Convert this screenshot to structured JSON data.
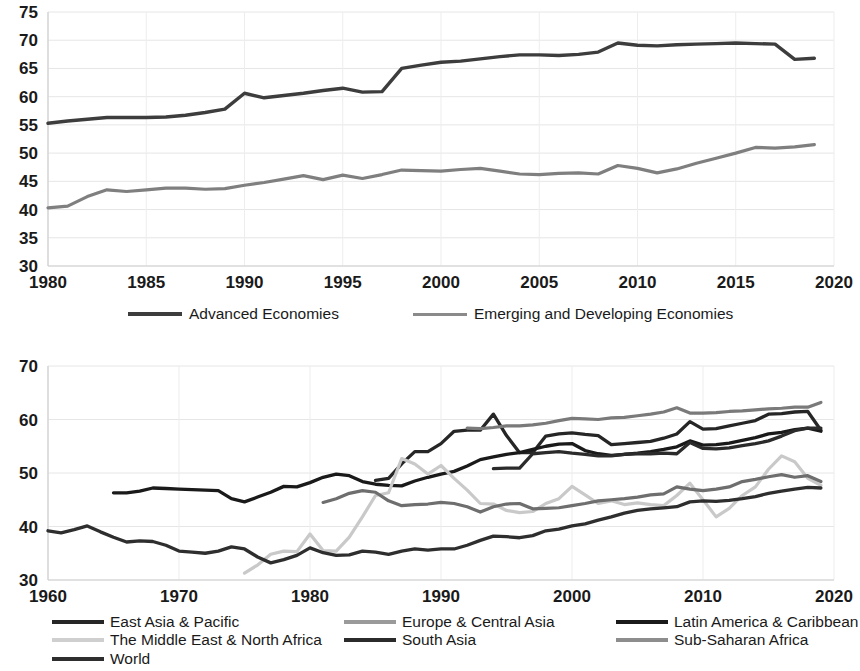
{
  "chart_data": [
    {
      "id": "top",
      "type": "line",
      "title": "",
      "xlabel": "",
      "ylabel": "",
      "xlim": [
        1980,
        2020
      ],
      "ylim": [
        30,
        75
      ],
      "xticks": [
        1980,
        1985,
        1990,
        1995,
        2000,
        2005,
        2010,
        2015,
        2020
      ],
      "yticks": [
        30,
        35,
        40,
        45,
        50,
        55,
        60,
        65,
        70,
        75
      ],
      "grid": "both-light",
      "legend_position": "below",
      "series": [
        {
          "name": "Advanced Economies",
          "color": "#3d3d3d",
          "width": 3.4,
          "x": [
            1980,
            1981,
            1982,
            1983,
            1984,
            1985,
            1986,
            1987,
            1988,
            1989,
            1990,
            1991,
            1992,
            1993,
            1994,
            1995,
            1996,
            1997,
            1998,
            1999,
            2000,
            2001,
            2002,
            2003,
            2004,
            2005,
            2006,
            2007,
            2008,
            2009,
            2010,
            2011,
            2012,
            2013,
            2014,
            2015,
            2016,
            2017,
            2018,
            2019
          ],
          "values": [
            55.3,
            55.7,
            56.0,
            56.3,
            56.3,
            56.3,
            56.4,
            56.7,
            57.2,
            57.8,
            60.6,
            59.8,
            60.2,
            60.6,
            61.1,
            61.5,
            60.8,
            60.9,
            65.0,
            65.6,
            66.1,
            66.3,
            66.7,
            67.1,
            67.4,
            67.4,
            67.3,
            67.5,
            67.9,
            69.5,
            69.1,
            69.0,
            69.2,
            69.3,
            69.4,
            69.5,
            69.4,
            69.3,
            66.6,
            66.8
          ]
        },
        {
          "name": "Emerging and Developing Economies",
          "color": "#7f7f7f",
          "width": 3.2,
          "x": [
            1980,
            1981,
            1982,
            1983,
            1984,
            1985,
            1986,
            1987,
            1988,
            1989,
            1990,
            1991,
            1992,
            1993,
            1994,
            1995,
            1996,
            1997,
            1998,
            1999,
            2000,
            2001,
            2002,
            2003,
            2004,
            2005,
            2006,
            2007,
            2008,
            2009,
            2010,
            2011,
            2012,
            2013,
            2014,
            2015,
            2016,
            2017,
            2018,
            2019
          ],
          "values": [
            40.3,
            40.6,
            42.3,
            43.5,
            43.2,
            43.5,
            43.8,
            43.8,
            43.6,
            43.7,
            44.3,
            44.8,
            45.4,
            46.0,
            45.3,
            46.1,
            45.5,
            46.2,
            47.0,
            46.9,
            46.8,
            47.1,
            47.3,
            46.8,
            46.3,
            46.2,
            46.4,
            46.5,
            46.3,
            47.8,
            47.3,
            46.5,
            47.2,
            48.2,
            49.1,
            50.0,
            51.0,
            50.9,
            51.1,
            51.5
          ]
        }
      ]
    },
    {
      "id": "bottom",
      "type": "line",
      "title": "",
      "xlabel": "",
      "ylabel": "",
      "xlim": [
        1960,
        2020
      ],
      "ylim": [
        30,
        70
      ],
      "xticks": [
        1960,
        1970,
        1980,
        1990,
        2000,
        2010,
        2020
      ],
      "yticks": [
        30,
        40,
        50,
        60,
        70
      ],
      "grid": "both-light",
      "legend_position": "below",
      "series": [
        {
          "name": "East Asia & Pacific",
          "color": "#262626",
          "width": 3.3,
          "x": [
            1985,
            1986,
            1987,
            1988,
            1989,
            1990,
            1991,
            1992,
            1993,
            1994,
            1995,
            1996,
            1997,
            1998,
            1999,
            2000,
            2001,
            2002,
            2003,
            2004,
            2005,
            2006,
            2007,
            2008,
            2009,
            2010,
            2011,
            2012,
            2013,
            2014,
            2015,
            2016,
            2017,
            2018,
            2019
          ],
          "values": [
            48.6,
            49.0,
            51.7,
            54.0,
            54.0,
            55.5,
            57.8,
            58.0,
            58.0,
            61.0,
            57.0,
            53.8,
            53.8,
            56.9,
            57.3,
            57.5,
            57.2,
            57.0,
            55.3,
            55.5,
            55.7,
            55.9,
            56.5,
            57.3,
            59.6,
            58.2,
            58.3,
            58.8,
            59.3,
            59.8,
            61.0,
            61.1,
            61.4,
            61.5,
            58.0
          ]
        },
        {
          "name": "Europe & Central Asia",
          "color": "#7a7a7a",
          "width": 3.2,
          "x": [
            1992,
            1993,
            1994,
            1995,
            1996,
            1997,
            1998,
            1999,
            2000,
            2001,
            2002,
            2003,
            2004,
            2005,
            2006,
            2007,
            2008,
            2009,
            2010,
            2011,
            2012,
            2013,
            2014,
            2015,
            2016,
            2017,
            2018,
            2019
          ],
          "values": [
            58.4,
            58.3,
            58.5,
            58.8,
            58.8,
            59.0,
            59.3,
            59.8,
            60.2,
            60.1,
            60.0,
            60.3,
            60.4,
            60.7,
            61.0,
            61.4,
            62.2,
            61.2,
            61.2,
            61.3,
            61.5,
            61.6,
            61.8,
            62.0,
            62.1,
            62.3,
            62.3,
            63.2
          ]
        },
        {
          "name": "Latin America & Caribbean",
          "color": "#1a1a1a",
          "width": 3.3,
          "x": [
            1965,
            1966,
            1967,
            1968,
            1969,
            1970,
            1971,
            1972,
            1973,
            1974,
            1975,
            1976,
            1977,
            1978,
            1979,
            1980,
            1981,
            1982,
            1983,
            1984,
            1985,
            1986,
            1987,
            1988,
            1989,
            1990,
            1991,
            1992,
            1993,
            1994,
            1995,
            1996,
            1997,
            1998,
            1999,
            2000,
            2001,
            2002,
            2003,
            2004,
            2005,
            2006,
            2007,
            2008,
            2009,
            2010,
            2011,
            2012,
            2013,
            2014,
            2015,
            2016,
            2017,
            2018,
            2019
          ],
          "values": [
            46.3,
            46.3,
            46.6,
            47.2,
            47.1,
            47.0,
            46.9,
            46.8,
            46.7,
            45.2,
            44.6,
            45.5,
            46.4,
            47.5,
            47.4,
            48.2,
            49.2,
            49.8,
            49.5,
            48.4,
            47.9,
            47.7,
            47.6,
            48.5,
            49.2,
            49.8,
            50.3,
            51.3,
            52.5,
            53.0,
            53.5,
            53.8,
            54.4,
            55.0,
            55.4,
            55.5,
            54.2,
            53.6,
            53.3,
            53.5,
            53.7,
            54.0,
            54.4,
            54.9,
            56.0,
            55.2,
            55.3,
            55.6,
            56.1,
            56.6,
            57.3,
            57.6,
            58.1,
            58.4,
            57.8
          ]
        },
        {
          "name": "The Middle East & North Africa",
          "color": "#c9c9c9",
          "width": 3.2,
          "x": [
            1975,
            1976,
            1977,
            1978,
            1979,
            1980,
            1981,
            1982,
            1983,
            1984,
            1985,
            1986,
            1987,
            1988,
            1989,
            1990,
            1991,
            1992,
            1993,
            1994,
            1995,
            1996,
            1997,
            1998,
            1999,
            2000,
            2001,
            2002,
            2003,
            2004,
            2005,
            2006,
            2007,
            2008,
            2009,
            2010,
            2011,
            2012,
            2013,
            2014,
            2015,
            2016,
            2017,
            2018,
            2019
          ],
          "values": [
            31.3,
            32.8,
            34.8,
            35.4,
            35.3,
            38.6,
            35.5,
            35.4,
            38.0,
            41.8,
            45.8,
            46.3,
            52.7,
            51.7,
            49.8,
            51.4,
            49.0,
            46.8,
            44.3,
            44.2,
            43.0,
            42.6,
            42.8,
            44.3,
            45.2,
            47.5,
            45.9,
            44.3,
            44.8,
            44.1,
            44.4,
            44.1,
            43.9,
            45.8,
            48.1,
            45.0,
            41.8,
            43.4,
            45.8,
            47.4,
            50.7,
            53.2,
            52.1,
            49.0,
            47.7
          ]
        },
        {
          "name": "South Asia",
          "color": "#2b2b2b",
          "width": 3.3,
          "x": [
            1994,
            1995,
            1996,
            1997,
            1998,
            1999,
            2000,
            2001,
            2002,
            2003,
            2004,
            2005,
            2006,
            2007,
            2008,
            2009,
            2010,
            2011,
            2012,
            2013,
            2014,
            2015,
            2016,
            2017,
            2018,
            2019
          ],
          "values": [
            50.8,
            50.9,
            50.9,
            53.6,
            53.8,
            54.0,
            53.7,
            53.5,
            53.2,
            53.2,
            53.5,
            53.6,
            53.6,
            53.7,
            53.6,
            55.7,
            54.6,
            54.5,
            54.7,
            55.1,
            55.5,
            56.0,
            56.9,
            57.9,
            58.4,
            58.4
          ]
        },
        {
          "name": "Sub-Saharan Africa",
          "color": "#6e6e6e",
          "width": 3.2,
          "x": [
            1981,
            1982,
            1983,
            1984,
            1985,
            1986,
            1987,
            1988,
            1989,
            1990,
            1991,
            1992,
            1993,
            1994,
            1995,
            1996,
            1997,
            1998,
            1999,
            2000,
            2001,
            2002,
            2003,
            2004,
            2005,
            2006,
            2007,
            2008,
            2009,
            2010,
            2011,
            2012,
            2013,
            2014,
            2015,
            2016,
            2017,
            2018,
            2019
          ],
          "values": [
            44.5,
            45.2,
            46.2,
            46.7,
            46.4,
            44.8,
            43.9,
            44.1,
            44.2,
            44.5,
            44.3,
            43.7,
            42.7,
            43.7,
            44.2,
            44.3,
            43.3,
            43.4,
            43.5,
            43.9,
            44.3,
            44.8,
            45.0,
            45.2,
            45.5,
            45.9,
            46.1,
            47.4,
            47.0,
            46.7,
            47.0,
            47.4,
            48.4,
            48.8,
            49.3,
            49.7,
            49.2,
            49.5,
            48.4
          ]
        },
        {
          "name": "World",
          "color": "#2e2e2e",
          "width": 3.3,
          "x": [
            1960,
            1961,
            1962,
            1963,
            1964,
            1965,
            1966,
            1967,
            1968,
            1969,
            1970,
            1971,
            1972,
            1973,
            1974,
            1975,
            1976,
            1977,
            1978,
            1979,
            1980,
            1981,
            1982,
            1983,
            1984,
            1985,
            1986,
            1987,
            1988,
            1989,
            1990,
            1991,
            1992,
            1993,
            1994,
            1995,
            1996,
            1997,
            1998,
            1999,
            2000,
            2001,
            2002,
            2003,
            2004,
            2005,
            2006,
            2007,
            2008,
            2009,
            2010,
            2011,
            2012,
            2013,
            2014,
            2015,
            2016,
            2017,
            2018,
            2019
          ],
          "values": [
            39.2,
            38.8,
            39.4,
            40.1,
            39.0,
            38.0,
            37.1,
            37.3,
            37.2,
            36.5,
            35.4,
            35.2,
            35.0,
            35.4,
            36.2,
            35.8,
            34.3,
            33.2,
            33.8,
            34.6,
            36.0,
            35.1,
            34.6,
            34.7,
            35.4,
            35.2,
            34.8,
            35.4,
            35.8,
            35.6,
            35.8,
            35.8,
            36.5,
            37.4,
            38.2,
            38.1,
            37.9,
            38.3,
            39.2,
            39.5,
            40.1,
            40.5,
            41.2,
            41.8,
            42.5,
            43.0,
            43.3,
            43.5,
            43.7,
            44.6,
            44.8,
            44.7,
            44.9,
            45.2,
            45.6,
            46.2,
            46.6,
            47.0,
            47.3,
            47.2
          ]
        }
      ]
    }
  ],
  "top_chart": {
    "yticks": [
      "75",
      "70",
      "65",
      "60",
      "55",
      "50",
      "45",
      "40",
      "35",
      "30"
    ],
    "xticks": [
      "1980",
      "1985",
      "1990",
      "1995",
      "2000",
      "2005",
      "2010",
      "2015",
      "2020"
    ],
    "legend": [
      {
        "label": "Advanced Economies",
        "color": "#3d3d3d"
      },
      {
        "label": "Emerging and Developing Economies",
        "color": "#8a8a8a"
      }
    ]
  },
  "bottom_chart": {
    "yticks": [
      "70",
      "60",
      "50",
      "40",
      "30"
    ],
    "xticks": [
      "1960",
      "1970",
      "1980",
      "1990",
      "2000",
      "2010",
      "2020"
    ],
    "legend": [
      {
        "label": "East Asia & Pacific",
        "color": "#262626"
      },
      {
        "label": "Europe & Central Asia",
        "color": "#9a9a9a"
      },
      {
        "label": "Latin America & Caribbean",
        "color": "#1a1a1a"
      },
      {
        "label": "The Middle East & North Africa",
        "color": "#cfcfcf"
      },
      {
        "label": "South Asia",
        "color": "#2b2b2b"
      },
      {
        "label": "Sub-Saharan Africa",
        "color": "#8d8d8d"
      },
      {
        "label": "World",
        "color": "#2e2e2e"
      }
    ]
  }
}
